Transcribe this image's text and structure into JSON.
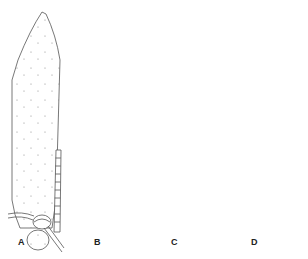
{
  "figure": {
    "top_fragment_text": "",
    "line_color": "#555555",
    "stipple_color": "#8a8a8a",
    "panels": [
      {
        "label": "A",
        "style": "sparse-dotted",
        "has_segmented_appendage": true
      },
      {
        "label": "B",
        "style": "internal-structure",
        "has_segmented_appendage": true
      },
      {
        "label": "C",
        "style": "dense-stippled",
        "has_segmented_appendage": false
      },
      {
        "label": "D",
        "style": "internal-structure",
        "has_segmented_appendage": true
      }
    ]
  }
}
